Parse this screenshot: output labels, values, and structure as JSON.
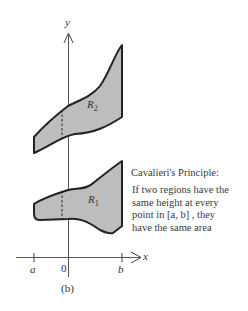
{
  "figure": {
    "label": "(b)",
    "axes": {
      "y_label": "y",
      "x_label": "x",
      "ticks": {
        "a": "a",
        "zero": "0",
        "b": "b"
      }
    },
    "regions": [
      {
        "name": "R2",
        "label_main": "R",
        "label_sub": "2",
        "fill": "#bdbdbd"
      },
      {
        "name": "R1",
        "label_main": "R",
        "label_sub": "1",
        "fill": "#bdbdbd"
      }
    ],
    "caption": {
      "title": "Cavalieri's Principle:",
      "lines": [
        "If two regions have the",
        "same height at every",
        "point in [a, b] , they",
        "have the same area"
      ]
    }
  }
}
